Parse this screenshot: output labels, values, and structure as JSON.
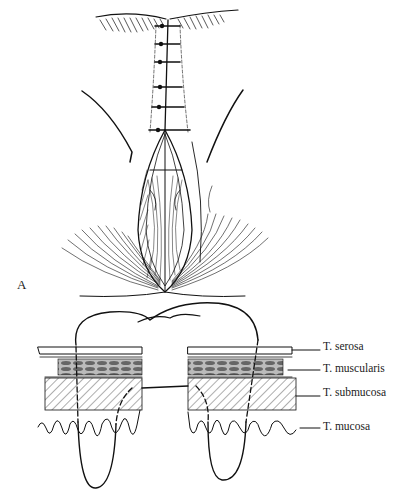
{
  "figure": {
    "panels": [
      {
        "id": "A",
        "label": "A",
        "description": "Closed midline incision with interrupted sutures above an opened elliptical wound exposing hatched tissue"
      },
      {
        "id": "B",
        "label": "B",
        "description": "Cross-section of the bowel wall showing suture path through tissue layers on both sides of the incision"
      }
    ],
    "layers": [
      {
        "name": "serosa",
        "label": "T. serosa"
      },
      {
        "name": "muscularis",
        "label": "T. muscularis"
      },
      {
        "name": "submucosa",
        "label": "T. submucosa"
      },
      {
        "name": "mucosa",
        "label": "T. mucosa"
      }
    ],
    "suture_count_panel_a": 6
  }
}
